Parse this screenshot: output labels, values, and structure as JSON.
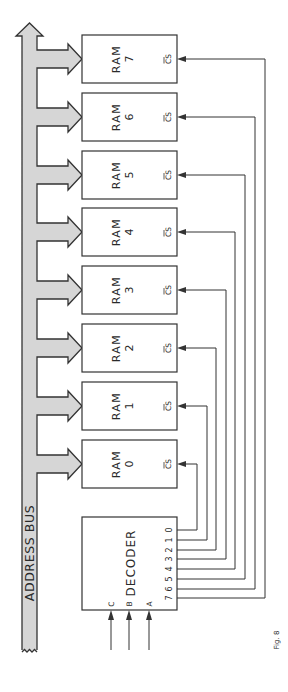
{
  "bus": {
    "label": "ADDRESS BUS",
    "fill": "#d6d6d6",
    "stroke": "#333333"
  },
  "rams": [
    {
      "name": "RAM",
      "index": "0",
      "cs": "CS"
    },
    {
      "name": "RAM",
      "index": "1",
      "cs": "CS"
    },
    {
      "name": "RAM",
      "index": "2",
      "cs": "CS"
    },
    {
      "name": "RAM",
      "index": "3",
      "cs": "CS"
    },
    {
      "name": "RAM",
      "index": "4",
      "cs": "CS"
    },
    {
      "name": "RAM",
      "index": "5",
      "cs": "CS"
    },
    {
      "name": "RAM",
      "index": "6",
      "cs": "CS"
    },
    {
      "name": "RAM",
      "index": "7",
      "cs": "CS"
    }
  ],
  "decoder": {
    "label": "DECODER",
    "inputs": [
      "C",
      "B",
      "A"
    ],
    "outputs": [
      "0",
      "1",
      "2",
      "3",
      "4",
      "5",
      "6",
      "7"
    ]
  },
  "caption": "Fig. 8"
}
